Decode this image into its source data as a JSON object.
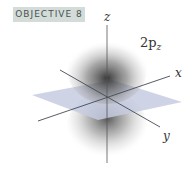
{
  "badge": {
    "label": "OBJECTIVE 8"
  },
  "figure": {
    "orbital_label": "2p",
    "orbital_subscript": "z",
    "axes": {
      "x": "x",
      "y": "y",
      "z": "z"
    },
    "colors": {
      "plane": "#c5cbe0",
      "axis": "#444a55",
      "lobe": "#3a3a3a",
      "badge_bg": "#d3dcd8"
    }
  }
}
